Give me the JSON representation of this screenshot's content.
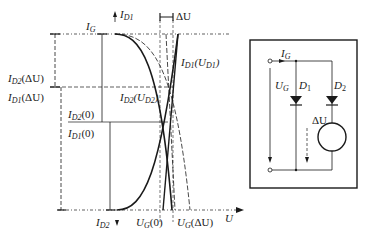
{
  "diagram": {
    "graph": {
      "labels": {
        "id1_axis": "I",
        "id1_axis_sub": "D1",
        "id2_axis": "I",
        "id2_axis_sub": "D2",
        "ig": "I",
        "ig_sub": "G",
        "delta_u_top": "ΔU",
        "id1_ud1": "I",
        "id1_ud1_sub": "D1",
        "id1_ud1_arg": "(U",
        "id1_ud1_arg_sub": "D1",
        "id1_ud1_close": ")",
        "id2_ud2": "I",
        "id2_ud2_sub": "D2",
        "id2_ud2_arg": "(U",
        "id2_ud2_arg_sub": "D2",
        "id2_ud2_close": ")",
        "id2_du": "I",
        "id2_du_sub": "D2",
        "id2_du_arg": "(ΔU)",
        "id1_du": "I",
        "id1_du_sub": "D1",
        "id1_du_arg": "(ΔU)",
        "id2_0": "I",
        "id2_0_sub": "D2",
        "id2_0_arg": "(0)",
        "id1_0": "I",
        "id1_0_sub": "D1",
        "id1_0_arg": "(0)",
        "ug_0": "U",
        "ug_0_sub": "G",
        "ug_0_arg": "(0)",
        "ug_du": "U",
        "ug_du_sub": "G",
        "ug_du_arg": "(ΔU)",
        "u_axis": "U"
      }
    },
    "circuit": {
      "labels": {
        "ig": "I",
        "ig_sub": "G",
        "ug": "U",
        "ug_sub": "G",
        "d1": "D",
        "d1_sub": "1",
        "d2": "D",
        "d2_sub": "2",
        "delta_u": "ΔU"
      }
    },
    "colors": {
      "ink": "#1a1a1a",
      "background": "#ffffff"
    }
  }
}
